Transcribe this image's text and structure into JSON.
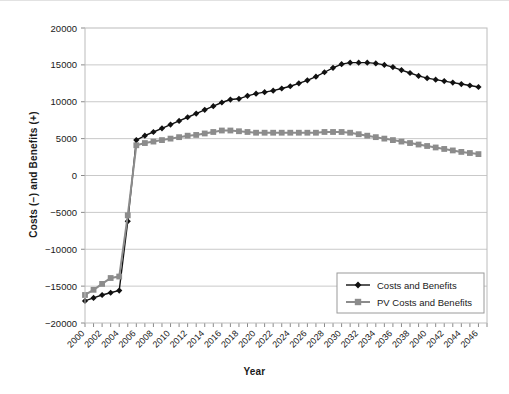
{
  "chart_data": {
    "type": "line",
    "title": "",
    "xlabel": "Year",
    "ylabel": "Costs (−) and Benefits (+)",
    "xlim": [
      2000,
      2047
    ],
    "ylim": [
      -20000,
      20000
    ],
    "ytick_values": [
      20000,
      15000,
      10000,
      5000,
      0,
      -5000,
      -10000,
      -15000,
      -20000
    ],
    "ytick_labels": [
      "20000",
      "15000",
      "10000",
      "5000",
      "0",
      "−5000",
      "−10000",
      "−15000",
      "−20000"
    ],
    "xtick_labels": [
      "2000",
      "2002",
      "2004",
      "2006",
      "2008",
      "2010",
      "2012",
      "2014",
      "2016",
      "2018",
      "2020",
      "2022",
      "2024",
      "2026",
      "2028",
      "2030",
      "2032",
      "2034",
      "2036",
      "2038",
      "2040",
      "2042",
      "2044",
      "2046"
    ],
    "xtick_step": 2,
    "minor_tick_step": 1,
    "grid": "horizontal",
    "legend_position": "lower-right",
    "x": [
      2000,
      2001,
      2002,
      2003,
      2004,
      2005,
      2006,
      2007,
      2008,
      2009,
      2010,
      2011,
      2012,
      2013,
      2014,
      2015,
      2016,
      2017,
      2018,
      2019,
      2020,
      2021,
      2022,
      2023,
      2024,
      2025,
      2026,
      2027,
      2028,
      2029,
      2030,
      2031,
      2032,
      2033,
      2034,
      2035,
      2036,
      2037,
      2038,
      2039,
      2040,
      2041,
      2042,
      2043,
      2044,
      2045,
      2046
    ],
    "series": [
      {
        "name": "Costs and Benefits",
        "color": "#111111",
        "marker": "diamond",
        "values": [
          -17000,
          -16600,
          -16200,
          -15900,
          -15600,
          -6200,
          4800,
          5400,
          5900,
          6400,
          6900,
          7400,
          7900,
          8400,
          8900,
          9400,
          9900,
          10300,
          10400,
          10800,
          11100,
          11300,
          11500,
          11800,
          12100,
          12500,
          12900,
          13400,
          14000,
          14600,
          15100,
          15300,
          15300,
          15300,
          15200,
          15000,
          14700,
          14300,
          13900,
          13500,
          13200,
          13000,
          12800,
          12600,
          12400,
          12200,
          12000
        ]
      },
      {
        "name": "PV Costs and Benefits",
        "color": "#8c8c8c",
        "marker": "square",
        "values": [
          -16200,
          -15500,
          -14700,
          -13900,
          -13700,
          -5400,
          4100,
          4400,
          4600,
          4800,
          5000,
          5200,
          5400,
          5500,
          5700,
          5900,
          6100,
          6100,
          6000,
          5900,
          5800,
          5800,
          5800,
          5800,
          5800,
          5800,
          5800,
          5800,
          5900,
          5900,
          5900,
          5800,
          5600,
          5400,
          5200,
          5000,
          4800,
          4600,
          4400,
          4200,
          4000,
          3800,
          3600,
          3400,
          3200,
          3050,
          2900
        ]
      }
    ]
  },
  "legend": {
    "entries": [
      {
        "label": "Costs and Benefits",
        "marker": "diamond-marker",
        "color": "#111111"
      },
      {
        "label": "PV Costs and Benefits",
        "marker": "square-marker",
        "color": "#8c8c8c"
      }
    ]
  }
}
